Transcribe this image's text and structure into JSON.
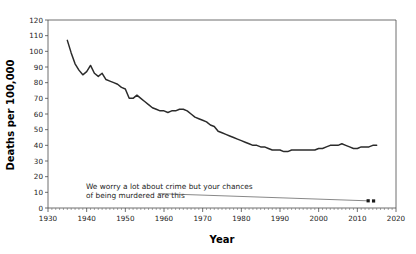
{
  "chart_data": {
    "type": "line",
    "title": "",
    "xlabel": "Year",
    "ylabel": "Deaths per 100,000",
    "xlim": [
      1930,
      2020
    ],
    "ylim": [
      0,
      120
    ],
    "grid": false,
    "legend": null,
    "x_ticks": [
      1930,
      1940,
      1950,
      1960,
      1970,
      1980,
      1990,
      2000,
      2010,
      2020
    ],
    "x_tick_labels": [
      "1930",
      "1940",
      "1950",
      "1960",
      "1970",
      "1980",
      "1990",
      "2000",
      "2010",
      "2020"
    ],
    "x_minor_tick_step": 1,
    "y_ticks": [
      0,
      10,
      20,
      30,
      40,
      50,
      60,
      70,
      80,
      90,
      100,
      110,
      120
    ],
    "y_tick_labels": [
      "0",
      "10",
      "20",
      "30",
      "40",
      "50",
      "60",
      "70",
      "80",
      "90",
      "100",
      "110",
      "120"
    ],
    "series": [
      {
        "name": "Deaths per 100,000",
        "color": "#2b2b2b",
        "x": [
          1935,
          1936,
          1937,
          1938,
          1939,
          1940,
          1941,
          1942,
          1943,
          1944,
          1945,
          1946,
          1947,
          1948,
          1949,
          1950,
          1951,
          1952,
          1953,
          1954,
          1955,
          1956,
          1957,
          1958,
          1959,
          1960,
          1961,
          1962,
          1963,
          1964,
          1965,
          1966,
          1967,
          1968,
          1969,
          1970,
          1971,
          1972,
          1973,
          1974,
          1975,
          1976,
          1977,
          1978,
          1979,
          1980,
          1981,
          1982,
          1983,
          1984,
          1985,
          1986,
          1987,
          1988,
          1989,
          1990,
          1991,
          1992,
          1993,
          1994,
          1995,
          1996,
          1997,
          1998,
          1999,
          2000,
          2001,
          2002,
          2003,
          2004,
          2005,
          2006,
          2007,
          2008,
          2009,
          2010,
          2011,
          2012,
          2013,
          2014,
          2015
        ],
        "y": [
          107,
          99,
          92,
          88,
          85,
          87,
          91,
          86,
          84,
          86,
          82,
          81,
          80,
          79,
          77,
          76,
          70,
          70,
          72,
          70,
          68,
          66,
          64,
          63,
          62,
          62,
          61,
          62,
          62,
          63,
          63,
          62,
          60,
          58,
          57,
          56,
          55,
          53,
          52,
          49,
          48,
          47,
          46,
          45,
          44,
          43,
          42,
          41,
          40,
          40,
          39,
          39,
          38,
          37,
          37,
          37,
          36,
          36,
          37,
          37,
          37,
          37,
          37,
          37,
          37,
          38,
          38,
          39,
          40,
          40,
          40,
          41,
          40,
          39,
          38,
          38,
          39,
          39,
          39,
          40,
          40
        ]
      }
    ],
    "annotations": [
      {
        "name": "crime-annotation",
        "line1": "We worry a lot about crime but your chances",
        "line2": "of being murdered are this",
        "pointer_from": [
          1958.5,
          9.2
        ],
        "pointer_to": [
          2012.5,
          4.6
        ],
        "markers": [
          [
            2012.8,
            4.6
          ],
          [
            2014.2,
            4.5
          ]
        ]
      }
    ]
  }
}
